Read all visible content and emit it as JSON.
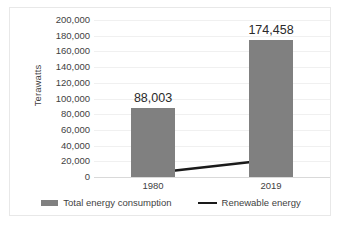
{
  "chart_data": {
    "type": "bar",
    "title": "",
    "xlabel": "",
    "ylabel": "Terawatts",
    "categories": [
      "1980",
      "2019"
    ],
    "ylim": [
      0,
      200000
    ],
    "yticks": [
      0,
      20000,
      40000,
      60000,
      80000,
      100000,
      120000,
      140000,
      160000,
      180000,
      200000
    ],
    "ytick_labels": [
      "0",
      "20,000",
      "40,000",
      "60,000",
      "80,000",
      "100,000",
      "120,000",
      "140,000",
      "160,000",
      "180,000",
      "200,000"
    ],
    "grid": true,
    "legend_position": "bottom",
    "series": [
      {
        "name": "Total energy consumption",
        "type": "bar",
        "color": "#808080",
        "values": [
          88003,
          174458
        ],
        "data_labels": [
          "88,003",
          "174,458"
        ]
      },
      {
        "name": "Renewable energy",
        "type": "line",
        "color": "#1a1a1a",
        "values": [
          5000,
          22000
        ],
        "data_labels": []
      }
    ]
  },
  "legend": {
    "items": [
      {
        "label": "Total energy consumption",
        "marker": "bar-swatch-icon",
        "color": "#808080"
      },
      {
        "label": "Renewable energy",
        "marker": "line-swatch-icon",
        "color": "#1a1a1a"
      }
    ]
  }
}
